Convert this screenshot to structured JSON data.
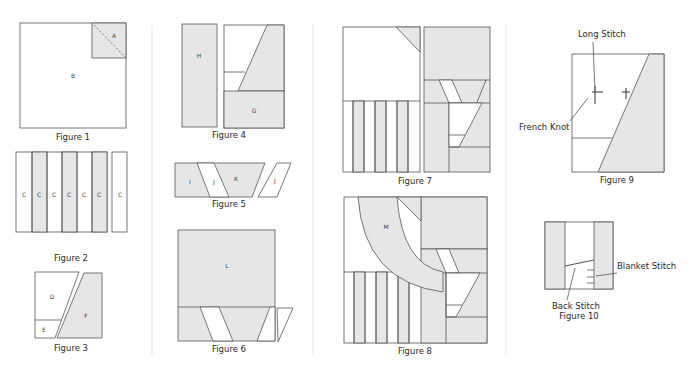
{
  "colors": {
    "shade": "#e6e6e6",
    "line": "#555555",
    "divider": "#ececec",
    "background": "#ffffff"
  },
  "figures": {
    "fig1": {
      "caption": "Figure 1",
      "labels": {
        "a": "A",
        "b": "B"
      }
    },
    "fig2": {
      "caption": "Figure 2",
      "labels": [
        "C",
        "C",
        "C",
        "C",
        "C",
        "C",
        "C"
      ]
    },
    "fig3": {
      "caption": "Figure 3",
      "labels": {
        "d": "D",
        "e": "E",
        "f": "F"
      }
    },
    "fig4": {
      "caption": "Figure 4",
      "labels": {
        "h": "H",
        "g": "G"
      }
    },
    "fig5": {
      "caption": "Figure 5",
      "labels": {
        "i": "I",
        "j1": "J",
        "k": "K",
        "j2": "J"
      }
    },
    "fig6": {
      "caption": "Figure 6",
      "labels": {
        "l": "L"
      }
    },
    "fig7": {
      "caption": "Figure 7"
    },
    "fig8": {
      "caption": "Figure 8",
      "labels": {
        "m": "M"
      }
    },
    "fig9": {
      "caption": "Figure 9",
      "annotations": {
        "long_stitch": "Long Stitch",
        "french_knot": "French Knot"
      }
    },
    "fig10": {
      "caption": "Figure 10",
      "annotations": {
        "blanket_stitch": "Blanket Stitch",
        "back_stitch": "Back Stitch"
      }
    }
  }
}
